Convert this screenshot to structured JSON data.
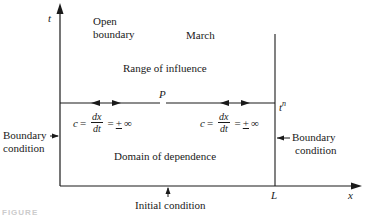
{
  "diagram": {
    "axes": {
      "vertical_label": "t",
      "horizontal_label": "x"
    },
    "labels": {
      "open_boundary_line1": "Open",
      "open_boundary_line2": "boundary",
      "march": "March",
      "range_of_influence": "Range of influence",
      "point": "P",
      "time_level": "t",
      "time_level_sup": "n",
      "domain_of_dependence": "Domain of dependence",
      "left_boundary_line1": "Boundary",
      "left_boundary_line2": "condition",
      "right_boundary_line1": "Boundary",
      "right_boundary_line2": "condition",
      "initial_condition": "Initial condition",
      "right_boundary_position": "L"
    },
    "equations": [
      {
        "lhs": "c",
        "eq": "=",
        "num": "dx",
        "den": "dt",
        "eq2": "=",
        "pm": "+",
        "inf": "∞"
      },
      {
        "lhs": "c",
        "eq": "=",
        "num": "dx",
        "den": "dt",
        "eq2": "=",
        "pm": "+",
        "inf": "∞"
      }
    ],
    "caption": "FIGURE",
    "colors": {
      "line": "#1a1a1a",
      "background": "#ffffff"
    }
  }
}
